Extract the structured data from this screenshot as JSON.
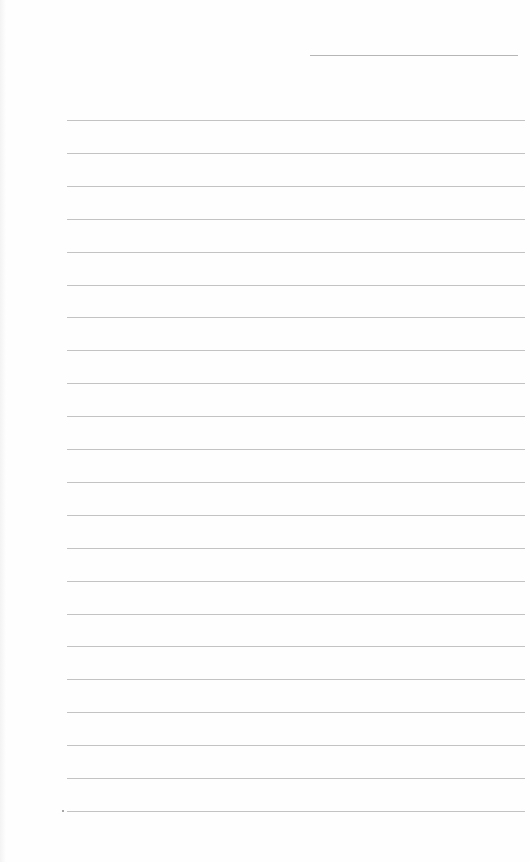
{
  "page": {
    "type": "blank lined writing sheet",
    "background": "#fefefe",
    "rule_color": "#b9b9b9",
    "header_line": {
      "x_start": 310,
      "x_end": 518,
      "y": 55
    },
    "body_lines": {
      "count": 22,
      "x_start": 67,
      "x_end": 525,
      "first_y": 120,
      "spacing": 32.9
    },
    "margin_mark": {
      "x": 63,
      "y": 811
    },
    "text_content": []
  }
}
